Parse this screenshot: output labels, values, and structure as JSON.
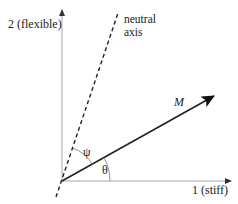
{
  "diagram": {
    "axes": {
      "vertical_label": "2 (flexible)",
      "horizontal_label": "1 (stiff)"
    },
    "neutral_axis": {
      "label_line1": "neutral",
      "label_line2": "axis"
    },
    "vector": {
      "label": "M"
    },
    "angles": {
      "psi": "ψ",
      "theta": "θ"
    },
    "colors": {
      "axis": "#a0a0a0",
      "line": "#1a1a1a",
      "text": "#222222"
    }
  }
}
